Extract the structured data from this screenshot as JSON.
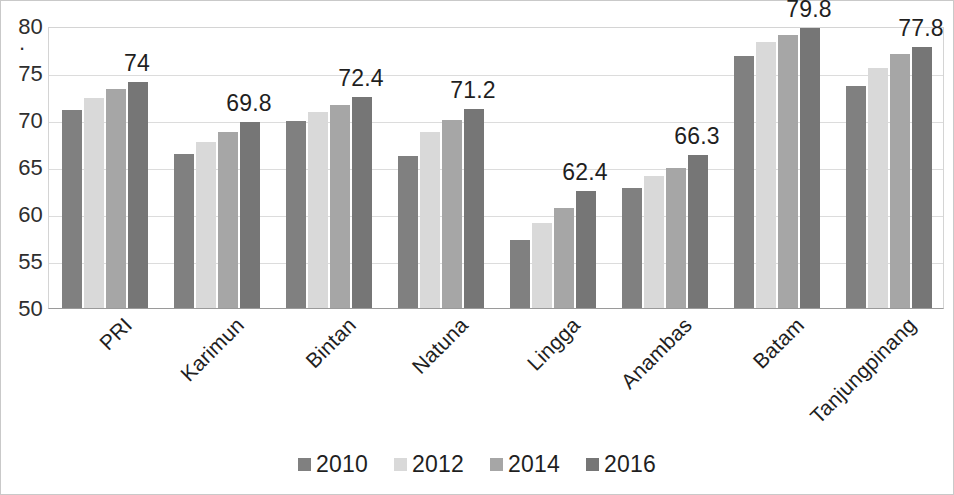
{
  "chart_data": {
    "type": "bar",
    "title": "",
    "subtitle": "",
    "xlabel": "",
    "ylabel": "",
    "ylim": [
      50,
      80
    ],
    "ytick_step": 5,
    "yticks": [
      "50",
      "55",
      "60",
      "65",
      "70",
      "75",
      "80"
    ],
    "grid": true,
    "legend_position": "bottom",
    "categories": [
      "PRI",
      "Karimun",
      "Bintan",
      "Natuna",
      "Lingga",
      "Anambas",
      "Batam",
      "Tanjungpinang"
    ],
    "series": [
      {
        "name": "2010",
        "color": "#808080",
        "values": [
          71.1,
          66.4,
          69.9,
          66.2,
          57.2,
          62.8,
          76.8,
          73.6
        ]
      },
      {
        "name": "2012",
        "color": "#d9d9d9",
        "values": [
          72.3,
          67.7,
          70.8,
          68.7,
          59.0,
          64.0,
          78.3,
          75.5
        ]
      },
      {
        "name": "2014",
        "color": "#a6a6a6",
        "values": [
          73.3,
          68.7,
          71.6,
          70.0,
          60.6,
          64.9,
          79.0,
          77.0
        ]
      },
      {
        "name": "2016",
        "color": "#767676",
        "values": [
          74.0,
          69.8,
          72.4,
          71.2,
          62.4,
          66.3,
          79.8,
          77.8
        ]
      }
    ],
    "data_labels": [
      "74",
      "69.8",
      "72.4",
      "71.2",
      "62.4",
      "66.3",
      "79.8",
      "77.8"
    ],
    "data_label_series": "2016"
  }
}
